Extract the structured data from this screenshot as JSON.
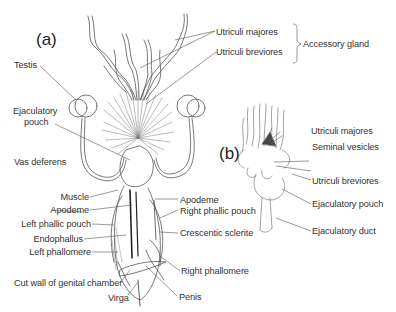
{
  "figure": {
    "panels": [
      {
        "id": "a",
        "label": "(a)"
      },
      {
        "id": "b",
        "label": "(b)"
      }
    ],
    "group_label": "Accessory gland",
    "labels_a": {
      "utriculi_majores": "Utriculi majores",
      "utriculi_breviores": "Utriculi breviores",
      "testis": "Testis",
      "ejaculatory_pouch": "Ejaculatory\npouch",
      "ejaculatory_pouch_line1": "Ejaculatory",
      "ejaculatory_pouch_line2": "pouch",
      "vas_deferens": "Vas deferens",
      "muscle": "Muscle",
      "apodeme_left": "Apodeme",
      "left_phallic_pouch": "Left phallic pouch",
      "endophallus": "Endophallus",
      "left_phallomere": "Left phallomere",
      "cut_wall": "Cut wall of genital chamber",
      "virga": "Virga",
      "apodeme_right": "Apodeme",
      "right_phallic_pouch": "Right phallic pouch",
      "crescentic_sclerite": "Crescentic sclerite",
      "right_phallomere": "Right phallomere",
      "penis": "Penis"
    },
    "labels_b": {
      "utriculi_majores": "Utriculi majores",
      "seminal_vesicles": "Seminal vesicles",
      "utriculi_breviores": "Utriculi breviores",
      "ejaculatory_pouch": "Ejaculatory pouch",
      "ejaculatory_duct": "Ejaculatory duct"
    }
  }
}
